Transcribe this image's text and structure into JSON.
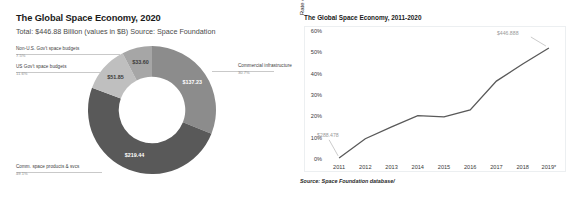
{
  "donut_panel": {
    "title": "The Global Space Economy, 2020",
    "subtitle": "Total: $446.88 Billion (values in $B)   Source: Space Foundation",
    "callouts": {
      "non_us_gov": {
        "label": "Non-U.S. Gov't space budgets",
        "pct": "7.5%"
      },
      "us_gov": {
        "label": "US Gov't space budgets",
        "pct": "11.6%"
      },
      "commercial_infrastructure": {
        "label": "Commercial infrastructure",
        "pct": "30.7%"
      },
      "comm_products": {
        "label": "Comm. space products & svcs",
        "pct": "49.1%"
      }
    }
  },
  "line_panel": {
    "title": "The Global Space Economy, 2011-2020",
    "source": "Source: Space Foundation database/",
    "annotation_start": "$288.478",
    "annotation_end": "$446.888"
  },
  "colors": {
    "slice_comm_products": "#595959",
    "slice_commercial_infrastructure": "#8c8c8c",
    "slice_us_gov": "#bfbfbf",
    "slice_non_us_gov": "#a6a6a6",
    "line_stroke": "#595959",
    "frame_border": "#eceff1"
  },
  "chart_data": [
    {
      "type": "pie",
      "title": "The Global Space Economy, 2020",
      "subtitle": "Total: $446.88 Billion (values in $B)   Source: Space Foundation",
      "unit": "$B",
      "total": 446.88,
      "labels": [
        "Commercial infrastructure",
        "Comm. space products & svcs",
        "US Gov't space budgets",
        "Non-U.S. Gov't space budgets"
      ],
      "values": [
        137.23,
        219.44,
        51.85,
        33.6
      ],
      "value_labels": [
        "$137.23",
        "$219.44",
        "$51.85",
        "$33.60"
      ],
      "percents": [
        "30.7%",
        "49.1%",
        "11.6%",
        "7.5%"
      ],
      "colors": [
        "#8c8c8c",
        "#595959",
        "#bfbfbf",
        "#a6a6a6"
      ],
      "donut": true,
      "hole_ratio": 0.52,
      "legend": "callout-labels-with-leader-lines"
    },
    {
      "type": "line",
      "title": "The Global Space Economy, 2011-2020",
      "xlabel": "",
      "ylabel": "Rate of Change Relative to 2010",
      "x": [
        "2011",
        "2012",
        "2013",
        "2014",
        "2015",
        "2016",
        "2017",
        "2018",
        "2019*"
      ],
      "categories": [
        "2011",
        "2012",
        "2013",
        "2014",
        "2015",
        "2016",
        "2017",
        "2018",
        "2019*"
      ],
      "series": [
        {
          "name": "Rate of Change Relative to 2010",
          "values": [
            1,
            10,
            15.5,
            20.8,
            20.2,
            23.5,
            37,
            45,
            52.5
          ]
        }
      ],
      "ytick_labels": [
        "0%",
        "10%",
        "20%",
        "30%",
        "40%",
        "50%",
        "60%"
      ],
      "ytick_values": [
        0,
        10,
        20,
        30,
        40,
        50,
        60
      ],
      "ylim": [
        0,
        60
      ],
      "grid": false,
      "legend": "none",
      "annotations": [
        {
          "text": "$288.478",
          "at_x": "2011",
          "position": "above-left"
        },
        {
          "text": "$446.888",
          "at_x": "2019*",
          "position": "above-left"
        }
      ],
      "source": "Source: Space Foundation database/"
    }
  ]
}
